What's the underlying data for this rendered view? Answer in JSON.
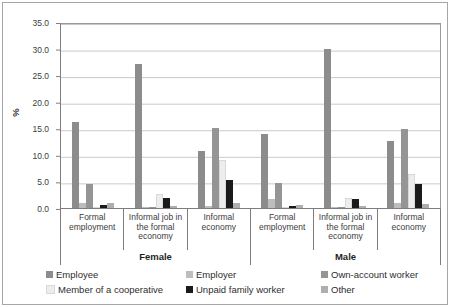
{
  "chart": {
    "y_axis_label": "%",
    "y_ticks": [
      "35.0",
      "30.0",
      "25.0",
      "20.0",
      "15.0",
      "10.0",
      "5.0",
      "0.0"
    ],
    "chart_data": {
      "type": "bar",
      "title": "",
      "xlabel": "",
      "ylabel": "%",
      "ylim": [
        0,
        35
      ],
      "grid": true,
      "legend_position": "bottom",
      "group_labels": [
        "Female",
        "Male"
      ],
      "categories": [
        "Formal employment",
        "Informal job in the formal economy",
        "Informal economy",
        "Formal employment",
        "Informal job in the formal economy",
        "Informal economy"
      ],
      "series": [
        {
          "name": "Employee",
          "color": "#8c8c8c",
          "values": [
            16.3,
            27.4,
            10.8,
            14.0,
            30.2,
            12.8
          ]
        },
        {
          "name": "Employer",
          "color": "#bdbdbd",
          "values": [
            1.0,
            0.1,
            0.3,
            1.7,
            0.1,
            0.9
          ]
        },
        {
          "name": "Own-account worker",
          "color": "#959595",
          "values": [
            4.5,
            0.2,
            15.2,
            4.7,
            0.2,
            15.0
          ]
        },
        {
          "name": "Member of a cooperative",
          "color": "#ededed",
          "values": [
            0.1,
            2.6,
            9.2,
            0.1,
            1.9,
            6.4
          ]
        },
        {
          "name": "Unpaid family worker",
          "color": "#1a1a1a",
          "values": [
            0.5,
            2.0,
            5.3,
            0.3,
            1.7,
            4.5
          ]
        },
        {
          "name": "Other",
          "color": "#aeaeae",
          "values": [
            0.9,
            0.3,
            1.0,
            0.6,
            0.3,
            0.7
          ]
        }
      ]
    }
  }
}
